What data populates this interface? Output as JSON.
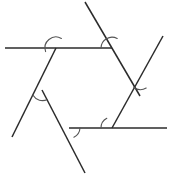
{
  "figure": {
    "canvas": {
      "width": 171,
      "height": 177
    },
    "background_color": "#ffffff",
    "line_color": "#2b2b2b",
    "arc_color": "#555555",
    "line_width": 1.5,
    "arc_width": 1.1,
    "shape_type": "hexagon",
    "vertex_count": 6,
    "arc_count": 6
  },
  "vertices": [
    {
      "name": "top-left-vertex",
      "x": 56,
      "y": 48
    },
    {
      "name": "top-right-vertex",
      "x": 112,
      "y": 48
    },
    {
      "name": "right-vertex",
      "x": 140,
      "y": 96
    },
    {
      "name": "bottom-right-vertex",
      "x": 112,
      "y": 128
    },
    {
      "name": "bottom-left-vertex",
      "x": 69,
      "y": 128
    },
    {
      "name": "left-vertex",
      "x": 42,
      "y": 90
    }
  ],
  "lines": [
    {
      "name": "top-horizontal-line",
      "x1": 5,
      "y1": 48,
      "x2": 112,
      "y2": 48
    },
    {
      "name": "upper-right-diagonal-line",
      "x1": 85,
      "y1": 2,
      "x2": 140,
      "y2": 96
    },
    {
      "name": "right-descending-diagonal-line",
      "x1": 163,
      "y1": 36,
      "x2": 112,
      "y2": 128
    },
    {
      "name": "bottom-horizontal-line",
      "x1": 167,
      "y1": 128,
      "x2": 69,
      "y2": 128
    },
    {
      "name": "lower-left-diagonal-line",
      "x1": 85,
      "y1": 173,
      "x2": 42,
      "y2": 90
    },
    {
      "name": "left-ascending-diagonal-line",
      "x1": 12,
      "y1": 137,
      "x2": 56,
      "y2": 48
    }
  ],
  "arcs": [
    {
      "name": "arc-top-left",
      "cx": 56,
      "cy": 48,
      "radius": 11
    },
    {
      "name": "arc-top-right",
      "cx": 112,
      "cy": 48,
      "radius": 11
    },
    {
      "name": "arc-right",
      "cx": 140,
      "cy": 96,
      "radius": 11
    },
    {
      "name": "arc-bottom-right",
      "cx": 112,
      "cy": 128,
      "radius": 11
    },
    {
      "name": "arc-bottom-left",
      "cx": 69,
      "cy": 128,
      "radius": 11
    },
    {
      "name": "arc-left",
      "cx": 42,
      "cy": 90,
      "radius": 11
    }
  ],
  "arc_paths": [
    {
      "name": "arc-top-left-path",
      "d": "M 45.6 51.6 A 11 11 0 0 1 61.4 38.4"
    },
    {
      "name": "arc-top-right-path",
      "d": "M 101.0 48.0 A 11 11 0 0 1 117.2 38.5"
    },
    {
      "name": "arc-right-path",
      "d": "M 133.6 87.0 A 11 11 0 0 0 146.2 88.0"
    },
    {
      "name": "arc-bottom-right-path",
      "d": "M 101.0 128.0 A 11 11 0 0 1 106.8 118.3"
    },
    {
      "name": "arc-bottom-left-path",
      "d": "M 80.0 128.0 A 11 11 0 0 1 73.9 137.2"
    },
    {
      "name": "arc-left-path",
      "d": "M 33.0 95.3 A 11 11 0 0 0 47.4 99.4"
    }
  ]
}
